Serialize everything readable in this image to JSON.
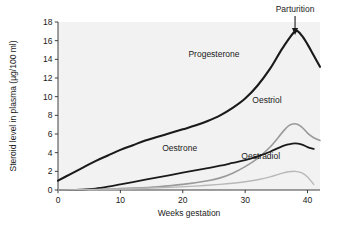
{
  "chart_data": {
    "type": "line",
    "title": "",
    "xlabel": "Weeks gestation",
    "ylabel": "Steroid level in plasma (µg/100 ml)",
    "xlim": [
      0,
      42
    ],
    "ylim": [
      0,
      18
    ],
    "xticks": [
      "0",
      "10",
      "20",
      "30",
      "40"
    ],
    "xtick_values": [
      0,
      10,
      20,
      30,
      40
    ],
    "yticks": [
      "0",
      "2",
      "4",
      "6",
      "8",
      "10",
      "12",
      "14",
      "16",
      "18"
    ],
    "ytick_values": [
      0,
      2,
      4,
      6,
      8,
      10,
      12,
      14,
      16,
      18
    ],
    "grid": false,
    "legend": "inline-labels",
    "plot_background": "#f2f2f2",
    "page_background": "#ffffff",
    "series": [
      {
        "name": "Progesterone",
        "color": "#1a1a1a",
        "width": 2.1,
        "label_x": 25,
        "label_y": 14.2,
        "x": [
          0,
          2,
          4,
          6,
          8,
          10,
          12,
          14,
          16,
          18,
          20,
          22,
          24,
          26,
          28,
          30,
          32,
          34,
          36,
          38,
          39,
          40,
          41,
          42
        ],
        "y": [
          1.0,
          1.7,
          2.4,
          3.1,
          3.7,
          4.3,
          4.8,
          5.3,
          5.7,
          6.1,
          6.5,
          6.9,
          7.4,
          8.0,
          8.8,
          9.8,
          11.2,
          13.0,
          15.2,
          17.0,
          16.6,
          15.6,
          14.4,
          13.2
        ]
      },
      {
        "name": "Oestriol",
        "color": "#9a9a9a",
        "width": 1.6,
        "label_x": 33.5,
        "label_y": 9.3,
        "x": [
          0,
          4,
          8,
          12,
          16,
          20,
          24,
          26,
          28,
          30,
          32,
          34,
          36,
          37,
          38,
          39,
          40,
          41,
          42
        ],
        "y": [
          0.0,
          0.05,
          0.1,
          0.2,
          0.35,
          0.6,
          1.0,
          1.3,
          1.8,
          2.5,
          3.4,
          4.6,
          6.2,
          6.9,
          7.1,
          6.8,
          6.1,
          5.6,
          5.3
        ]
      },
      {
        "name": "Oestrone",
        "color": "#1a1a1a",
        "width": 1.8,
        "label_x": 19.5,
        "label_y": 4.2,
        "x": [
          0,
          4,
          6,
          8,
          10,
          12,
          14,
          16,
          18,
          20,
          22,
          24,
          26,
          28,
          30,
          32,
          34,
          36,
          37,
          38,
          39,
          40,
          41
        ],
        "y": [
          0.0,
          0.05,
          0.15,
          0.35,
          0.6,
          0.85,
          1.1,
          1.35,
          1.6,
          1.85,
          2.1,
          2.35,
          2.6,
          2.9,
          3.2,
          3.6,
          4.1,
          4.7,
          4.9,
          5.0,
          4.9,
          4.6,
          4.4
        ]
      },
      {
        "name": "Oestradiol",
        "color": "#b8b8b8",
        "width": 1.4,
        "label_x": 32.5,
        "label_y": 3.3,
        "x": [
          0,
          6,
          10,
          14,
          18,
          22,
          26,
          28,
          30,
          32,
          34,
          36,
          37,
          38,
          39,
          40,
          41
        ],
        "y": [
          0.0,
          0.05,
          0.1,
          0.18,
          0.28,
          0.42,
          0.6,
          0.72,
          0.88,
          1.1,
          1.4,
          1.8,
          1.95,
          2.0,
          1.85,
          1.4,
          0.6
        ]
      }
    ],
    "annotations": [
      {
        "name": "parturition",
        "text": "Parturition",
        "x": 38,
        "y": 18,
        "arrow": "down"
      }
    ]
  }
}
